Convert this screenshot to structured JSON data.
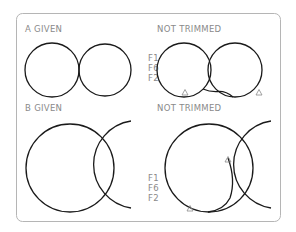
{
  "panels": {
    "a_given": {
      "title": "A  GIVEN"
    },
    "a_result": {
      "title": "NOT  TRIMMED",
      "labels": [
        "F1",
        "F6",
        "F2"
      ]
    },
    "b_given": {
      "title": "B  GIVEN"
    },
    "b_result": {
      "title": "NOT  TRIMMED",
      "labels": [
        "F1",
        "F6",
        "F2"
      ]
    }
  },
  "colors": {
    "curve": "#1a1a1a",
    "label": "#8a8a8a",
    "frame": "#b5b5b5"
  }
}
